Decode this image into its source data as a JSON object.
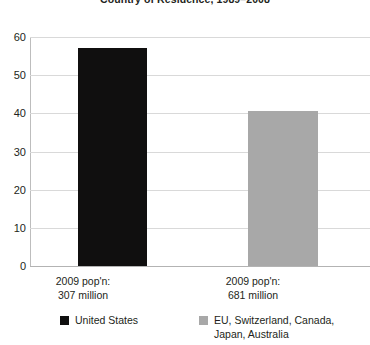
{
  "chart_data": {
    "type": "bar",
    "title": "Country of Residence, 1989–2008",
    "xlabel": "",
    "ylabel": "",
    "ylim": [
      0,
      60
    ],
    "yticks": [
      "0",
      "10",
      "20",
      "30",
      "40",
      "50",
      "60"
    ],
    "grid": true,
    "legend_position": "bottom",
    "categories": [
      "2009 pop'n:\n307 million",
      "2009 pop'n:\n681 million"
    ],
    "category_lines": [
      [
        "2009 pop'n:",
        "307 million"
      ],
      [
        "2009 pop'n:",
        "681 million"
      ]
    ],
    "values": [
      57,
      40.5
    ],
    "series": [
      {
        "name": "United States",
        "color": "#100f0f",
        "value": 57,
        "category": "2009 pop'n: 307 million"
      },
      {
        "name": "EU, Switzerland, Canada,\nJapan, Australia",
        "color": "#a8a8a8",
        "value": 40.5,
        "category": "2009 pop'n: 681 million"
      }
    ],
    "legend": [
      {
        "label": "United States",
        "color": "#100f0f"
      },
      {
        "label": "EU, Switzerland, Canada,\nJapan, Australia",
        "color": "#a8a8a8"
      }
    ],
    "colors": {
      "bar_dark": "#100f0f",
      "bar_light": "#a8a8a8",
      "gridline": "#d9d9d9",
      "axis": "#b3b3b3",
      "text": "#231f20"
    }
  }
}
